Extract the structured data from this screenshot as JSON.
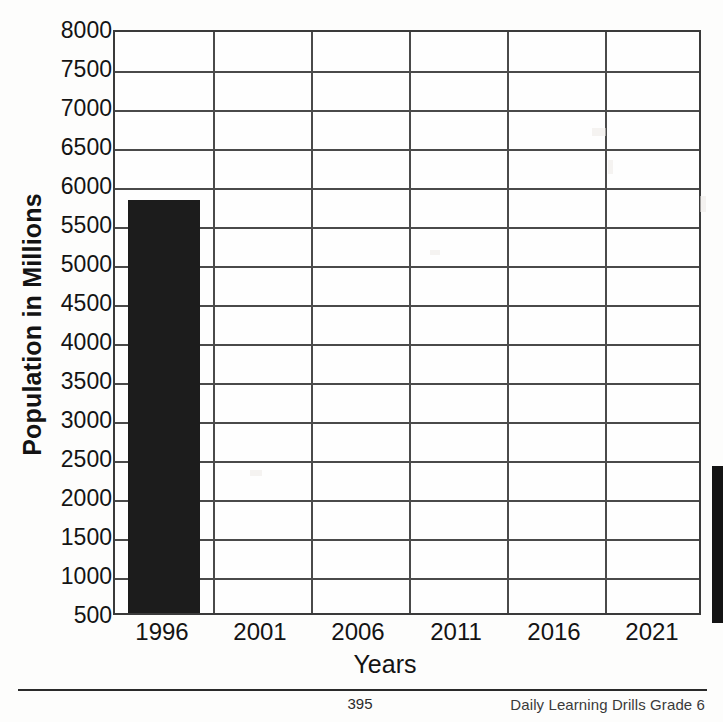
{
  "chart_data": {
    "type": "bar",
    "title": "",
    "xlabel": "Years",
    "ylabel": "Population in Millions",
    "categories": [
      "1996",
      "2001",
      "2006",
      "2011",
      "2016",
      "2021"
    ],
    "values": [
      5800,
      null,
      null,
      null,
      null,
      null
    ],
    "ylim": [
      500,
      8000
    ],
    "ytick_labels": [
      "8000",
      "7500",
      "7000",
      "6500",
      "6000",
      "5500",
      "5000",
      "4500",
      "4000",
      "3500",
      "3000",
      "2500",
      "2000",
      "1500",
      "1000",
      "500"
    ],
    "ytick_values": [
      8000,
      7500,
      7000,
      6500,
      6000,
      5500,
      5000,
      4500,
      4000,
      3500,
      3000,
      2500,
      2000,
      1500,
      1000,
      500
    ],
    "grid": true,
    "legend": "none",
    "bar_color": "#1c1c1c",
    "grid_color": "#4a4a4a",
    "axis_color": "#3a3a3a"
  },
  "axes": {
    "y_title": "Population in Millions",
    "x_title": "Years"
  },
  "footer": {
    "page_number": "395",
    "credit": "Daily Learning Drills Grade 6"
  }
}
